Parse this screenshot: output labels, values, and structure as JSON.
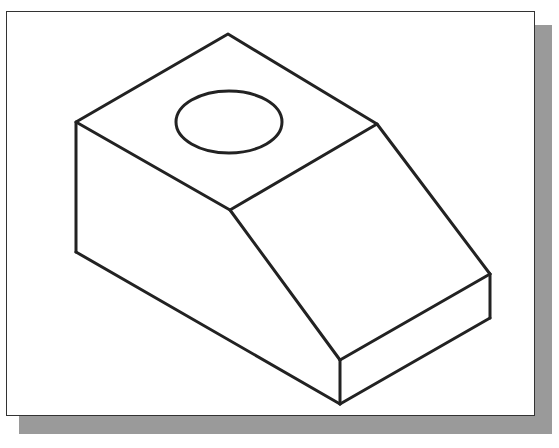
{
  "figure": {
    "type": "isometric-view",
    "colors": {
      "line": "#222222",
      "background": "#ffffff",
      "shadow": "#9a9a9a",
      "frame": "#333333"
    },
    "elements": [
      "top-face",
      "hole-ellipse",
      "left-face",
      "sloped-face",
      "front-step-face"
    ]
  }
}
